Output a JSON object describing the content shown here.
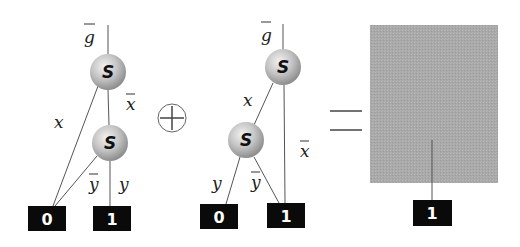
{
  "diagram": {
    "operator_symbol": "+",
    "equals_symbol": "=",
    "colors": {
      "node_fill_light": "#e6e6e6",
      "node_fill_dark": "#9a9a9a",
      "terminal_fill": "#0a0a0a",
      "result_fill": "#a8a8a8",
      "edge": "#555555"
    },
    "left_bdd": {
      "root_label": "g",
      "root_label_overbar": true,
      "nodes": [
        {
          "id": "n1",
          "label": "S"
        },
        {
          "id": "n2",
          "label": "S"
        }
      ],
      "edges": [
        {
          "from": "n1",
          "to": "t0",
          "label": "x",
          "overbar": false
        },
        {
          "from": "n1",
          "to": "n2",
          "label": "x",
          "overbar": true
        },
        {
          "from": "n2",
          "to": "t0",
          "label": "y",
          "overbar": true
        },
        {
          "from": "n2",
          "to": "t1",
          "label": "y",
          "overbar": false
        }
      ],
      "terminals": [
        {
          "id": "t0",
          "label": "0"
        },
        {
          "id": "t1",
          "label": "1"
        }
      ]
    },
    "right_bdd": {
      "root_label": "g",
      "root_label_overbar": true,
      "nodes": [
        {
          "id": "m1",
          "label": "S"
        },
        {
          "id": "m2",
          "label": "S"
        }
      ],
      "edges": [
        {
          "from": "m1",
          "to": "m2",
          "label": "x",
          "overbar": false
        },
        {
          "from": "m1",
          "to": "u1",
          "label": "x",
          "overbar": true
        },
        {
          "from": "m2",
          "to": "u0",
          "label": "y",
          "overbar": false
        },
        {
          "from": "m2",
          "to": "u1",
          "label": "y",
          "overbar": true
        }
      ],
      "terminals": [
        {
          "id": "u0",
          "label": "0"
        },
        {
          "id": "u1",
          "label": "1"
        }
      ]
    },
    "result": {
      "terminal_label": "1"
    },
    "labels": {
      "g": "g",
      "x": "x",
      "y": "y",
      "S": "S",
      "zero": "0",
      "one": "1"
    }
  }
}
